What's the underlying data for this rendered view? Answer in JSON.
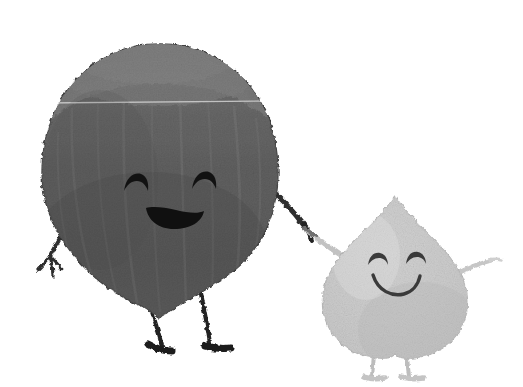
{
  "image": {
    "title": "Two hand-drawn nut characters holding hands",
    "style": "textured pencil / stamped illustration on plain white background",
    "background_color": "#ffffff",
    "width": 523,
    "height": 387
  },
  "characters": [
    {
      "id": "large-nut",
      "name": "Large dark nut character",
      "shape": "round chestnut with pointed bottom and fuzzy lighter cap on top",
      "body_color": "#5a5a5a",
      "cap_color": "#8e8e8e",
      "outline_color": "#3d3d3d",
      "texture": "vertical striations with grainy speckle",
      "center_x": 160,
      "center_y": 175,
      "radius_x": 118,
      "radius_y": 120,
      "face": {
        "expression": "happy",
        "eye_style": "closed arc",
        "eye_color": "#121212",
        "mouth_style": "filled crescent smile",
        "mouth_color": "#101010",
        "left_eye_x": 137,
        "left_eye_y": 184,
        "right_eye_x": 205,
        "right_eye_y": 182,
        "mouth_x": 175,
        "mouth_y": 216
      },
      "limbs": {
        "arm_color": "#2e2e2e",
        "leg_color": "#232323",
        "left_arm": "extends down-left with small fingers",
        "right_arm": "extends down-right to hold the small character's hand",
        "legs": "two thin legs with small dark feet pointing outward"
      }
    },
    {
      "id": "small-nut",
      "name": "Small light nut character",
      "shape": "teardrop / heart with pointed top",
      "body_color": "#c9c9c9",
      "highlight_color": "#dcdcdc",
      "outline_color": "#b0b0b0",
      "texture": "grainy speckle",
      "center_x": 395,
      "center_y": 285,
      "radius_x": 72,
      "radius_y": 95,
      "apex_x": 395,
      "apex_y": 196,
      "face": {
        "expression": "happy",
        "eye_style": "closed arc",
        "eye_color": "#3a3a3a",
        "mouth_style": "thin curved smile",
        "mouth_color": "#3a3a3a",
        "left_eye_x": 378,
        "left_eye_y": 259,
        "right_eye_x": 416,
        "right_eye_y": 258,
        "mouth_x": 397,
        "mouth_y": 279
      },
      "limbs": {
        "arm_color": "#c0c0c0",
        "leg_color": "#bdbdbd",
        "left_arm": "extends up-left to hold the large character's hand",
        "right_arm": "extends up-right and outward",
        "legs": "two thin light legs with small feet"
      }
    }
  ],
  "interaction": {
    "description": "The two characters are holding hands",
    "hands_x": 310,
    "hands_y": 232
  },
  "details": {
    "horizontal_light_line_y": 103,
    "horizontal_light_line_label": "faint light horizontal seam across the large nut"
  }
}
